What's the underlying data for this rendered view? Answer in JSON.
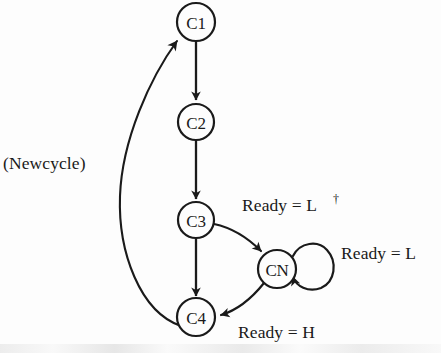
{
  "figure": {
    "type": "state-transition-diagram",
    "background_color": "#fdfdfd",
    "stroke_color": "#1a1a1a",
    "nodes": [
      {
        "id": "C1",
        "label": "C1",
        "cx": 196,
        "cy": 22,
        "r": 19
      },
      {
        "id": "C2",
        "label": "C2",
        "cx": 196,
        "cy": 122,
        "r": 18
      },
      {
        "id": "C3",
        "label": "C3",
        "cx": 196,
        "cy": 220,
        "r": 18
      },
      {
        "id": "CN",
        "label": "CN",
        "cx": 277,
        "cy": 269,
        "r": 19
      },
      {
        "id": "C4",
        "label": "C4",
        "cx": 196,
        "cy": 317,
        "r": 19
      }
    ],
    "edges": [
      {
        "from": "C1",
        "to": "C2",
        "label": ""
      },
      {
        "from": "C2",
        "to": "C3",
        "label": ""
      },
      {
        "from": "C3",
        "to": "C4",
        "label": ""
      },
      {
        "from": "C3",
        "to": "CN",
        "label": "Ready = L†"
      },
      {
        "from": "CN",
        "to": "CN",
        "label": "Ready = L"
      },
      {
        "from": "CN",
        "to": "C4",
        "label": "Ready = H"
      },
      {
        "from": "C4",
        "to": "C1",
        "label": "(Newcycle)"
      }
    ],
    "labels": {
      "newcycle": "(Newcycle)",
      "ready_l_dagger_text": "Ready = L",
      "ready_l_dagger_mark": "†",
      "ready_l": "Ready = L",
      "ready_h": "Ready = H"
    }
  }
}
